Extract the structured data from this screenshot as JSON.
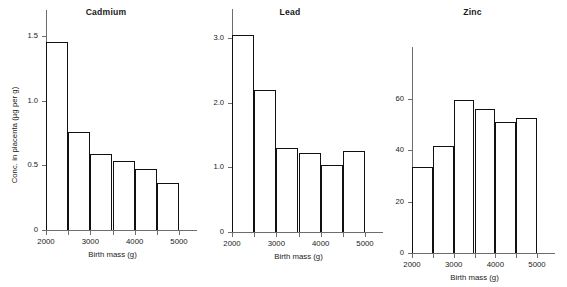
{
  "figure": {
    "width": 567,
    "height": 287,
    "background": "#ffffff",
    "ink_color": "#111111",
    "axis_color": "#6d6d6d",
    "shared_ylabel": "Conc. in placenta (µg per g)",
    "shared_xlabel": "Birth mass (g)"
  },
  "chart_data": [
    {
      "type": "bar",
      "title": "Cadmium",
      "xlabel": "Birth mass (g)",
      "ylabel": "Conc. in placenta (µg per g)",
      "categories": [
        "2000-2500",
        "2500-3000",
        "3000-3500",
        "3500-4000",
        "4000-4500",
        "4500-5000"
      ],
      "bin_edges": [
        2000,
        2500,
        3000,
        3500,
        4000,
        4500,
        5000
      ],
      "values": [
        1.45,
        0.76,
        0.59,
        0.53,
        0.47,
        0.36
      ],
      "xlim": [
        2000,
        5000
      ],
      "ylim": [
        0,
        1.7
      ],
      "yticks": [
        0,
        0.5,
        1.0,
        1.5
      ],
      "ytick_labels": [
        "0",
        "0.5",
        "1.0",
        "1.5"
      ],
      "xticks": [
        2000,
        2500,
        3000,
        3500,
        4000,
        4500,
        5000
      ],
      "xtick_labels": [
        "2000",
        "",
        "3000",
        "",
        "4000",
        "",
        "5000"
      ],
      "grid": false,
      "legend": "none"
    },
    {
      "type": "bar",
      "title": "Lead",
      "xlabel": "Birth mass (g)",
      "ylabel": "Conc. in placenta (µg per g)",
      "categories": [
        "2000-2500",
        "2500-3000",
        "3000-3500",
        "3500-4000",
        "4000-4500",
        "4500-5000"
      ],
      "bin_edges": [
        2000,
        2500,
        3000,
        3500,
        4000,
        4500,
        5000
      ],
      "values": [
        3.05,
        2.2,
        1.3,
        1.22,
        1.04,
        1.25
      ],
      "xlim": [
        2000,
        5000
      ],
      "ylim": [
        0,
        3.45
      ],
      "yticks": [
        0,
        1.0,
        2.0,
        3.0
      ],
      "ytick_labels": [
        "0",
        "1.0",
        "2.0",
        "3.0"
      ],
      "xticks": [
        2000,
        2500,
        3000,
        3500,
        4000,
        4500,
        5000
      ],
      "xtick_labels": [
        "2000",
        "",
        "3000",
        "",
        "4000",
        "",
        "5000"
      ],
      "grid": false,
      "legend": "none"
    },
    {
      "type": "bar",
      "title": "Zinc",
      "xlabel": "Birth mass (g)",
      "ylabel": "Conc. in placenta (µg per g)",
      "categories": [
        "2000-2500",
        "2500-3000",
        "3000-3500",
        "3500-4000",
        "4000-4500",
        "4500-5000"
      ],
      "bin_edges": [
        2000,
        2500,
        3000,
        3500,
        4000,
        4500,
        5000
      ],
      "values": [
        33.5,
        41.5,
        59.5,
        56.0,
        51.0,
        52.5
      ],
      "xlim": [
        2000,
        5000
      ],
      "ylim": [
        0,
        80
      ],
      "yticks": [
        0,
        20,
        40,
        60
      ],
      "ytick_labels": [
        "0",
        "20",
        "40",
        "60"
      ],
      "xticks": [
        2000,
        2500,
        3000,
        3500,
        4000,
        4500,
        5000
      ],
      "xtick_labels": [
        "2000",
        "",
        "3000",
        "",
        "4000",
        "",
        "5000"
      ],
      "grid": false,
      "legend": "none"
    }
  ]
}
